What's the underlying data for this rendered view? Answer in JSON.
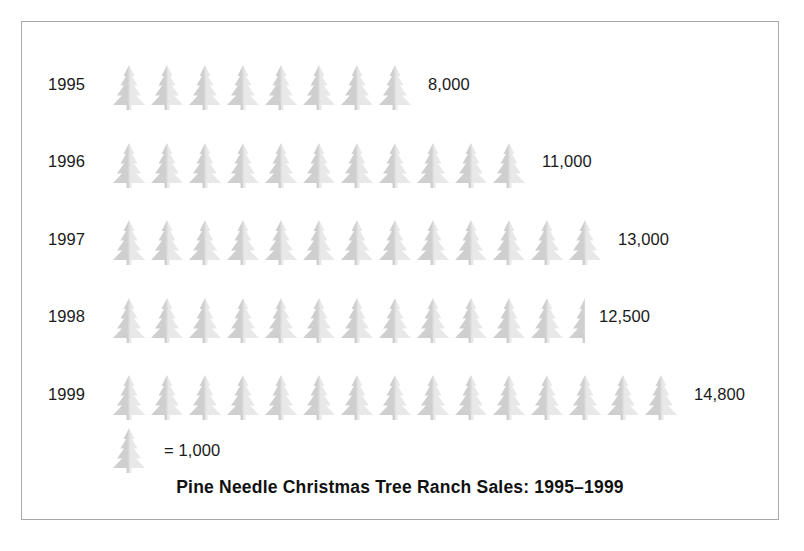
{
  "chart_data": {
    "type": "bar",
    "subtype": "pictograph",
    "title": "Pine Needle Christmas Tree Ranch Sales: 1995–1999",
    "xlabel": "",
    "ylabel": "",
    "icon": "christmas-tree",
    "icon_unit_value": 1000,
    "legend_text": "= 1,000",
    "legend_position": "bottom-left",
    "grid": false,
    "categories": [
      "1995",
      "1996",
      "1997",
      "1998",
      "1999"
    ],
    "values": [
      8000,
      11000,
      13000,
      12500,
      14800
    ],
    "value_labels": [
      "8,000",
      "11,000",
      "13,000",
      "12,500",
      "14,800"
    ],
    "icon_counts": [
      8,
      11,
      13,
      12.5,
      15
    ],
    "rows": [
      {
        "year": "1995",
        "value_label": "8,000",
        "value": 8000,
        "full_icons": 8,
        "half_icon": false
      },
      {
        "year": "1996",
        "value_label": "11,000",
        "value": 11000,
        "full_icons": 11,
        "half_icon": false
      },
      {
        "year": "1997",
        "value_label": "13,000",
        "value": 13000,
        "full_icons": 13,
        "half_icon": false
      },
      {
        "year": "1998",
        "value_label": "12,500",
        "value": 12500,
        "full_icons": 12,
        "half_icon": true
      },
      {
        "year": "1999",
        "value_label": "14,800",
        "value": 14800,
        "full_icons": 15,
        "half_icon": false
      }
    ],
    "colors": {
      "icon_fill": "#cfcfcf",
      "icon_fill_light": "#e8e8e8",
      "text": "#1a1a1a",
      "border": "#a8a8a8",
      "background": "#ffffff"
    }
  }
}
